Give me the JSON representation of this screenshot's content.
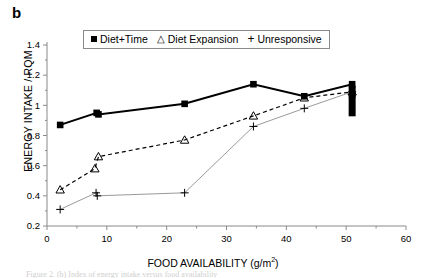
{
  "panel": {
    "label": "b"
  },
  "legend": {
    "position": "top-center",
    "entries": [
      {
        "marker": "filled-square",
        "label": "Diet+Time"
      },
      {
        "marker": "open-triangle",
        "label": "Diet Expansion"
      },
      {
        "marker": "plus",
        "label": "Unresponsive"
      }
    ]
  },
  "axes": {
    "ylabel": "ENERGY INTAKE / RQM",
    "xlabel_main": "FOOD AVAILABILITY (g/m",
    "xlabel_sup": "2",
    "xlabel_close": ")",
    "yticks": [
      "0.2",
      "0.4",
      "0.6",
      "0.8",
      "1",
      "1.2",
      "1.4"
    ],
    "xticks": [
      "0",
      "10",
      "20",
      "30",
      "40",
      "50",
      "60"
    ]
  },
  "caption": {
    "text": "Figure 2. (b) Index of energy intake versus food availability"
  },
  "colors": {
    "axis": "#8a8a8a",
    "diet_time_line": "#000000",
    "diet_expansion_line": "#000000",
    "unresponsive_line": "#9a9a9a",
    "marker": "#000000"
  },
  "chart_data": {
    "type": "line",
    "title": "",
    "xlabel": "FOOD AVAILABILITY (g/m2)",
    "ylabel": "ENERGY INTAKE / RQM",
    "xlim": [
      0,
      60
    ],
    "ylim": [
      0.2,
      1.4
    ],
    "xticks": [
      0,
      10,
      20,
      30,
      40,
      50,
      60
    ],
    "yticks": [
      0.2,
      0.4,
      0.6,
      0.8,
      1.0,
      1.2,
      1.4
    ],
    "grid": false,
    "legend_position": "top-center",
    "series": [
      {
        "name": "Diet+Time",
        "marker": "filled-square",
        "linestyle": "solid",
        "linewidth": 2,
        "points": [
          {
            "x": 2.2,
            "y": 0.87
          },
          {
            "x": 8.3,
            "y": 0.95
          },
          {
            "x": 8.6,
            "y": 0.94
          },
          {
            "x": 23.0,
            "y": 1.01
          },
          {
            "x": 34.5,
            "y": 1.14
          },
          {
            "x": 43.0,
            "y": 1.06
          },
          {
            "x": 51.0,
            "y": 1.14
          },
          {
            "x": 51.0,
            "y": 1.07
          }
        ]
      },
      {
        "name": "Diet Expansion",
        "marker": "open-triangle",
        "linestyle": "dashed",
        "linewidth": 1.2,
        "points": [
          {
            "x": 2.2,
            "y": 0.44
          },
          {
            "x": 8.0,
            "y": 0.58
          },
          {
            "x": 8.6,
            "y": 0.66
          },
          {
            "x": 23.0,
            "y": 0.77
          },
          {
            "x": 34.5,
            "y": 0.93
          },
          {
            "x": 43.0,
            "y": 1.05
          },
          {
            "x": 51.0,
            "y": 1.09
          }
        ]
      },
      {
        "name": "Unresponsive",
        "marker": "plus",
        "linestyle": "solid",
        "linewidth": 1,
        "points": [
          {
            "x": 2.2,
            "y": 0.31
          },
          {
            "x": 8.4,
            "y": 0.4
          },
          {
            "x": 8.2,
            "y": 0.42
          },
          {
            "x": 23.0,
            "y": 0.42
          },
          {
            "x": 34.5,
            "y": 0.86
          },
          {
            "x": 43.0,
            "y": 0.98
          },
          {
            "x": 51.0,
            "y": 1.09
          }
        ]
      }
    ],
    "annotations": [
      {
        "type": "error-bar",
        "x": 51.0,
        "y_low": 1.02,
        "y_high": 1.13,
        "note": "thick vertical bar at right edge"
      }
    ]
  }
}
